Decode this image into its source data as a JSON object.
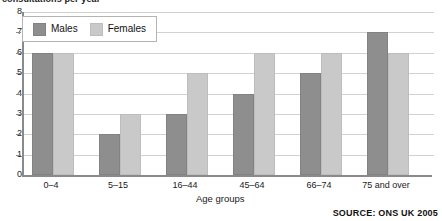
{
  "chart_data": {
    "type": "bar",
    "title": "consultations per year",
    "xlabel": "Age groups",
    "ylabel": "",
    "categories": [
      "0–4",
      "5–15",
      "16–44",
      "45–64",
      "66–74",
      "75 and over"
    ],
    "series": [
      {
        "name": "Males",
        "color": "#8e8e8e",
        "values": [
          6,
          2,
          3,
          4,
          5,
          7
        ]
      },
      {
        "name": "Females",
        "color": "#c9c9c9",
        "values": [
          6,
          3,
          5,
          6,
          6,
          6
        ]
      }
    ],
    "ylim": [
      0,
      8
    ],
    "y_ticks": [
      "0",
      "1",
      "2",
      "3",
      "4",
      "5",
      "6",
      "7",
      "8"
    ],
    "grid": true,
    "legend_position": "top-left"
  },
  "legend": {
    "items": [
      {
        "label": "Males",
        "swatch": "males-swatch"
      },
      {
        "label": "Females",
        "swatch": "females-swatch"
      }
    ]
  },
  "footer": {
    "source": "SOURCE: ONS UK 2005"
  }
}
